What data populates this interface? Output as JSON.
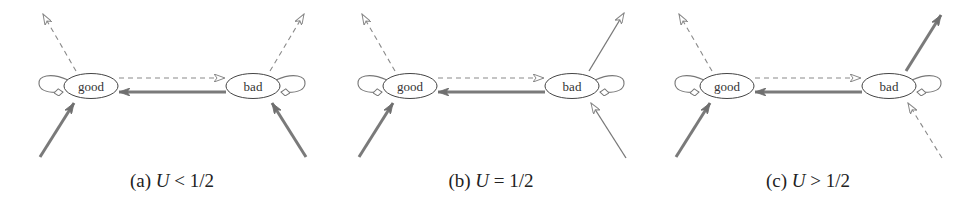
{
  "figure": {
    "node_labels": {
      "good": "good",
      "bad": "bad"
    },
    "colors": {
      "thick": "#7a7a7a",
      "thin": "#777777",
      "dashed": "#8a8a8a",
      "node_stroke": "#444444"
    },
    "panels": [
      {
        "id": "a",
        "caption": {
          "tag": "(a)",
          "var": "U",
          "rel": "<",
          "value": "1/2"
        },
        "good_out": "dashed",
        "good_in": "thick",
        "bad_out": "dashed",
        "bad_in": "thick"
      },
      {
        "id": "b",
        "caption": {
          "tag": "(b)",
          "var": "U",
          "rel": "=",
          "value": "1/2"
        },
        "good_out": "dashed",
        "good_in": "thick",
        "bad_out": "thin",
        "bad_in": "thin"
      },
      {
        "id": "c",
        "caption": {
          "tag": "(c)",
          "var": "U",
          "rel": ">",
          "value": "1/2"
        },
        "good_out": "dashed",
        "good_in": "thick",
        "bad_out": "thick",
        "bad_in": "dashed"
      }
    ]
  }
}
